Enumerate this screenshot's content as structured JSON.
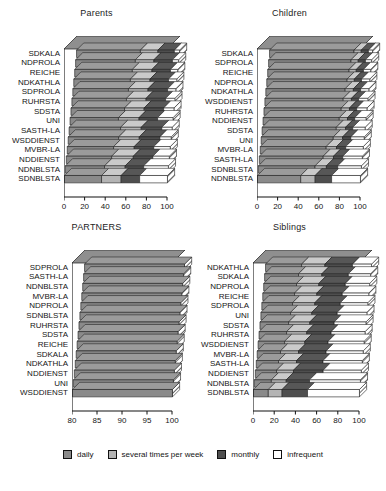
{
  "figure": {
    "legend": {
      "items": [
        {
          "label": "daily",
          "color": "#8a8a8a"
        },
        {
          "label": "several times per week",
          "color": "#b4b4b4"
        },
        {
          "label": "monthly",
          "color": "#4e4e4e"
        },
        {
          "label": "infrequent",
          "color": "#ffffff"
        }
      ]
    }
  },
  "chart_data": [
    {
      "type": "bar",
      "orientation": "horizontal",
      "stacked": true,
      "percent": true,
      "title": "Parents",
      "xlabel": "",
      "ylabel": "",
      "xlim": [
        0,
        100
      ],
      "xticks": [
        0,
        20,
        40,
        60,
        80,
        100
      ],
      "grid": false,
      "legend_position": "figure-bottom",
      "series": [
        {
          "name": "daily",
          "color": "#8a8a8a"
        },
        {
          "name": "several times per week",
          "color": "#b4b4b4"
        },
        {
          "name": "monthly",
          "color": "#4e4e4e"
        },
        {
          "name": "infrequent",
          "color": "#ffffff"
        }
      ],
      "categories": [
        "SDKALA",
        "NDPROLA",
        "REICHE",
        "NDKATHLA",
        "SDPROLA",
        "RUHRSTA",
        "SDSTA",
        "UNI",
        "SASTH-LA",
        "WSDDIENST",
        "MVBR-LA",
        "NDDIENST",
        "NDNBLSTA",
        "SDNBLSTA"
      ],
      "values": [
        [
          62,
          17,
          16,
          5
        ],
        [
          58,
          18,
          18,
          6
        ],
        [
          56,
          19,
          18,
          7
        ],
        [
          55,
          19,
          18,
          8
        ],
        [
          54,
          19,
          19,
          8
        ],
        [
          53,
          19,
          19,
          9
        ],
        [
          52,
          19,
          19,
          10
        ],
        [
          47,
          20,
          18,
          15
        ],
        [
          50,
          20,
          20,
          10
        ],
        [
          49,
          20,
          20,
          11
        ],
        [
          45,
          20,
          19,
          16
        ],
        [
          44,
          21,
          19,
          16
        ],
        [
          38,
          20,
          18,
          24
        ],
        [
          36,
          19,
          18,
          27
        ]
      ]
    },
    {
      "type": "bar",
      "orientation": "horizontal",
      "stacked": true,
      "percent": true,
      "title": "Children",
      "xlabel": "",
      "ylabel": "",
      "xlim": [
        0,
        100
      ],
      "xticks": [
        0,
        20,
        40,
        60,
        80,
        100
      ],
      "grid": false,
      "legend_position": "figure-bottom",
      "series": [
        {
          "name": "daily",
          "color": "#8a8a8a"
        },
        {
          "name": "several times per week",
          "color": "#b4b4b4"
        },
        {
          "name": "monthly",
          "color": "#4e4e4e"
        },
        {
          "name": "infrequent",
          "color": "#ffffff"
        }
      ],
      "categories": [
        "SDKALA",
        "SDPROLA",
        "REICHE",
        "NDPROLA",
        "NDKATHLA",
        "WSDDIENST",
        "RUHRSTA",
        "NDDIENST",
        "SDSTA",
        "UNI",
        "MVBR-LA",
        "SASTH-LA",
        "SDNBLSTA",
        "NDNBLSTA"
      ],
      "values": [
        [
          82,
          7,
          7,
          4
        ],
        [
          80,
          7,
          7,
          6
        ],
        [
          79,
          7,
          7,
          7
        ],
        [
          78,
          7,
          7,
          8
        ],
        [
          77,
          8,
          7,
          8
        ],
        [
          76,
          8,
          7,
          9
        ],
        [
          75,
          8,
          7,
          10
        ],
        [
          74,
          8,
          7,
          11
        ],
        [
          72,
          9,
          7,
          12
        ],
        [
          70,
          9,
          8,
          13
        ],
        [
          64,
          10,
          9,
          17
        ],
        [
          62,
          10,
          9,
          19
        ],
        [
          55,
          11,
          11,
          23
        ],
        [
          42,
          14,
          16,
          28
        ]
      ]
    },
    {
      "type": "bar",
      "orientation": "horizontal",
      "stacked": true,
      "percent": true,
      "title": "PARTNERS",
      "xlabel": "",
      "ylabel": "",
      "xlim": [
        80,
        100
      ],
      "xticks": [
        80,
        85,
        90,
        95,
        100
      ],
      "grid": false,
      "legend_position": "figure-bottom",
      "series": [
        {
          "name": "daily",
          "color": "#8a8a8a"
        },
        {
          "name": "several times per week",
          "color": "#b4b4b4"
        },
        {
          "name": "monthly",
          "color": "#4e4e4e"
        },
        {
          "name": "infrequent",
          "color": "#ffffff"
        }
      ],
      "categories": [
        "SDPROLA",
        "SASTH-LA",
        "NDNBLSTA",
        "MVBR-LA",
        "NDPROLA",
        "SDNBLSTA",
        "RUHRSTA",
        "SDSTA",
        "REICHE",
        "SDKALA",
        "NDKATHLA",
        "NDDIENST",
        "UNI",
        "WSDDIENST"
      ],
      "values": [
        [
          98.2,
          1.0,
          0.5,
          0.3
        ],
        [
          97.5,
          1.3,
          0.7,
          0.5
        ],
        [
          97.0,
          1.5,
          0.9,
          0.6
        ],
        [
          95.5,
          2.2,
          1.4,
          0.9
        ],
        [
          95.2,
          2.4,
          1.4,
          1.0
        ],
        [
          95.0,
          2.4,
          1.5,
          1.1
        ],
        [
          94.5,
          2.6,
          1.7,
          1.2
        ],
        [
          94.0,
          2.8,
          1.8,
          1.4
        ],
        [
          93.5,
          3.0,
          1.9,
          1.6
        ],
        [
          92.5,
          3.4,
          2.2,
          1.9
        ],
        [
          92.0,
          3.6,
          2.3,
          2.1
        ],
        [
          91.0,
          4.0,
          2.6,
          2.4
        ],
        [
          90.5,
          4.2,
          2.7,
          2.6
        ],
        [
          88.5,
          5.0,
          3.3,
          3.2
        ]
      ]
    },
    {
      "type": "bar",
      "orientation": "horizontal",
      "stacked": true,
      "percent": true,
      "title": "Siblings",
      "xlabel": "",
      "ylabel": "",
      "xlim": [
        0,
        100
      ],
      "xticks": [
        0,
        20,
        40,
        60,
        80,
        100
      ],
      "grid": false,
      "legend_position": "figure-bottom",
      "series": [
        {
          "name": "daily",
          "color": "#8a8a8a"
        },
        {
          "name": "several times per week",
          "color": "#b4b4b4"
        },
        {
          "name": "monthly",
          "color": "#4e4e4e"
        },
        {
          "name": "infrequent",
          "color": "#ffffff"
        }
      ],
      "categories": [
        "NDKATHLA",
        "SDKALA",
        "NDPROLA",
        "REICHE",
        "SDPROLA",
        "UNI",
        "SDSTA",
        "RUHRSTA",
        "WSDDIENST",
        "MVBR-LA",
        "SASTH-LA",
        "NDDIENST",
        "NDNBLSTA",
        "SDNBLSTA"
      ],
      "values": [
        [
          34,
          22,
          26,
          18
        ],
        [
          32,
          22,
          25,
          21
        ],
        [
          31,
          21,
          25,
          23
        ],
        [
          30,
          21,
          24,
          25
        ],
        [
          29,
          21,
          24,
          26
        ],
        [
          28,
          20,
          24,
          28
        ],
        [
          27,
          20,
          23,
          30
        ],
        [
          26,
          19,
          23,
          32
        ],
        [
          25,
          19,
          22,
          34
        ],
        [
          22,
          17,
          26,
          35
        ],
        [
          21,
          17,
          25,
          37
        ],
        [
          20,
          16,
          28,
          36
        ],
        [
          16,
          14,
          22,
          48
        ],
        [
          14,
          13,
          24,
          49
        ]
      ]
    }
  ]
}
